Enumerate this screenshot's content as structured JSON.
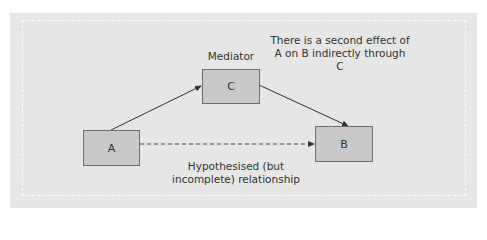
{
  "diagram": {
    "nodes": {
      "a": {
        "label": "A"
      },
      "b": {
        "label": "B"
      },
      "c": {
        "label": "C"
      }
    },
    "labels": {
      "mediator": "Mediator",
      "note_line1": "There is a second effect of",
      "note_line2": "A on B indirectly through",
      "note_line3": "C",
      "hypothesised_line1": "Hypothesised (but",
      "hypothesised_line2": "incomplete) relationship"
    },
    "edges": [
      {
        "from": "A",
        "to": "C",
        "style": "solid"
      },
      {
        "from": "C",
        "to": "B",
        "style": "solid"
      },
      {
        "from": "A",
        "to": "B",
        "style": "dashed"
      }
    ],
    "colors": {
      "panel": "#e6e6e6",
      "box_fill": "#c9c9c9",
      "box_border": "#6f6f6f",
      "arrow": "#333333"
    }
  }
}
